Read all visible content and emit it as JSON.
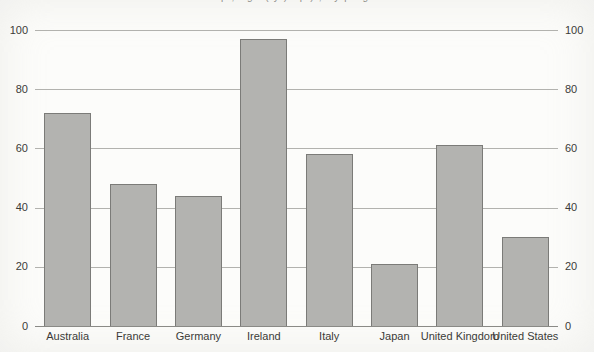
{
  "title_fragment": "p, g (y) p), yp g",
  "colors": {
    "background": "#fcfcfa",
    "bar_fill": "#b3b3b0",
    "bar_border": "#7b7b78",
    "gridline": "#b2b2ae",
    "axis_line": "#8a8a86",
    "tick_text": "#3b3b38"
  },
  "chart_data": {
    "type": "bar",
    "categories": [
      "Australia",
      "France",
      "Germany",
      "Ireland",
      "Italy",
      "Japan",
      "United Kingdom",
      "United States"
    ],
    "values": [
      72,
      48,
      44,
      97,
      58,
      21,
      61,
      30
    ],
    "title": "",
    "xlabel": "",
    "ylabel": "",
    "ylim": [
      0,
      100
    ],
    "yticks": [
      0,
      20,
      40,
      60,
      80,
      100
    ],
    "grid": true,
    "dual_y_axis": true,
    "legend": "none"
  }
}
